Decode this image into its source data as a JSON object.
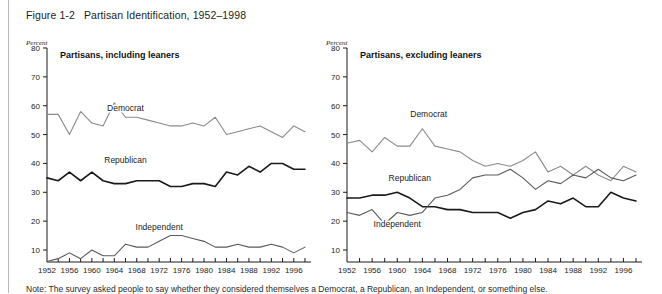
{
  "figure": {
    "title": "Figure 1-2   Partisan Identification, 1952–1998",
    "note": "Note: The survey asked people to say whether they considered themselves a Democrat, a Republican, an Independent, or something else."
  },
  "axis": {
    "percent_label": "Percent",
    "y_ticks": [
      80,
      70,
      60,
      50,
      40,
      30,
      20,
      10
    ],
    "x_ticks_labeled": [
      1952,
      1956,
      1960,
      1964,
      1968,
      1972,
      1976,
      1980,
      1984,
      1988,
      1992,
      1996
    ],
    "x_tick_step_minor": 2,
    "xlim": [
      1952,
      1998
    ],
    "ylim": [
      0,
      80
    ]
  },
  "colors": {
    "democrat": "#8a8a8a",
    "republican": "#1a1a1a",
    "independent": "#5a5a5a",
    "axis": "#1a1a1a",
    "background": "#ffffff"
  },
  "chart_data": [
    {
      "type": "line",
      "title": "Partisans, including leaners",
      "xlabel": "",
      "ylabel": "Percent",
      "xlim": [
        1952,
        1998
      ],
      "ylim": [
        0,
        80
      ],
      "grid": false,
      "legend": "inline-labels",
      "x": [
        1952,
        1954,
        1956,
        1958,
        1960,
        1962,
        1964,
        1966,
        1968,
        1970,
        1972,
        1974,
        1976,
        1978,
        1980,
        1982,
        1984,
        1986,
        1988,
        1990,
        1992,
        1994,
        1996,
        1998
      ],
      "series": [
        {
          "name": "Democrat",
          "color": "#8a8a8a",
          "label_x": 1966,
          "label_y": 58,
          "values": [
            57,
            57,
            50,
            58,
            54,
            53,
            61,
            56,
            56,
            55,
            54,
            53,
            53,
            54,
            53,
            56,
            50,
            51,
            52,
            53,
            51,
            49,
            53,
            51
          ]
        },
        {
          "name": "Republican",
          "color": "#1a1a1a",
          "label_x": 1966,
          "label_y": 40,
          "values": [
            35,
            34,
            37,
            34,
            37,
            34,
            33,
            33,
            34,
            34,
            34,
            32,
            32,
            33,
            33,
            32,
            37,
            36,
            39,
            37,
            40,
            40,
            38,
            38
          ]
        },
        {
          "name": "Independent",
          "color": "#5a5a5a",
          "label_x": 1972,
          "label_y": 17,
          "values": [
            6,
            7,
            9,
            7,
            10,
            8,
            8,
            12,
            11,
            11,
            13,
            15,
            15,
            14,
            13,
            11,
            11,
            12,
            11,
            11,
            12,
            11,
            9,
            11
          ]
        }
      ]
    },
    {
      "type": "line",
      "title": "Partisans, excluding leaners",
      "xlabel": "",
      "ylabel": "Percent",
      "xlim": [
        1952,
        1998
      ],
      "ylim": [
        0,
        80
      ],
      "grid": false,
      "legend": "inline-labels",
      "x": [
        1952,
        1954,
        1956,
        1958,
        1960,
        1962,
        1964,
        1966,
        1968,
        1970,
        1972,
        1974,
        1976,
        1978,
        1980,
        1982,
        1984,
        1986,
        1988,
        1990,
        1992,
        1994,
        1996,
        1998
      ],
      "series": [
        {
          "name": "Democrat",
          "color": "#8a8a8a",
          "label_x": 1965,
          "label_y": 56,
          "values": [
            47,
            48,
            44,
            49,
            46,
            46,
            52,
            46,
            45,
            44,
            41,
            39,
            40,
            39,
            41,
            44,
            37,
            39,
            36,
            39,
            36,
            34,
            39,
            37
          ]
        },
        {
          "name": "Republican",
          "color": "#1a1a1a",
          "label_x": 1962,
          "label_y": 34,
          "values": [
            28,
            28,
            29,
            29,
            30,
            28,
            25,
            25,
            24,
            24,
            23,
            23,
            23,
            21,
            23,
            24,
            27,
            26,
            28,
            25,
            25,
            30,
            28,
            27
          ]
        },
        {
          "name": "Independent",
          "color": "#5a5a5a",
          "label_x": 1960,
          "label_y": 18,
          "values": [
            23,
            22,
            24,
            19,
            23,
            22,
            23,
            28,
            29,
            31,
            35,
            36,
            36,
            38,
            35,
            31,
            34,
            33,
            36,
            35,
            38,
            35,
            34,
            36
          ]
        }
      ]
    }
  ]
}
